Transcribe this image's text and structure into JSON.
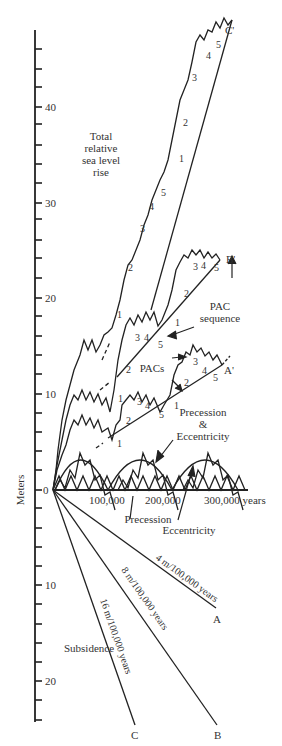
{
  "figure": {
    "y_axis_label": "Meters",
    "y_ticks_up": [
      "40",
      "30",
      "20",
      "10",
      "0"
    ],
    "y_ticks_down": [
      "10",
      "20"
    ],
    "x_ticks": [
      "100,000",
      "200,000",
      "300,000 years"
    ],
    "labels": {
      "total_rise": [
        "Total",
        "relative",
        "sea level",
        "rise"
      ],
      "pac_sequence": [
        "PAC",
        "sequence"
      ],
      "pacs": "PACs",
      "prec_ecc": [
        "Precession",
        "&",
        "Eccentricity"
      ],
      "precession": "Precession",
      "eccentricity": "Eccentricity",
      "subsidence": "Subsidence",
      "rate_a": "4 m/100,000 years",
      "rate_b": "8 m/100,000 years",
      "rate_c": "16 m/100,000 years",
      "end_a": "A",
      "end_b": "B",
      "end_c": "C",
      "end_a_prime": "A'",
      "end_b_prime": "B'",
      "end_c_prime": "C'"
    },
    "pac_numbers": [
      "1",
      "2",
      "3",
      "4",
      "5"
    ]
  }
}
